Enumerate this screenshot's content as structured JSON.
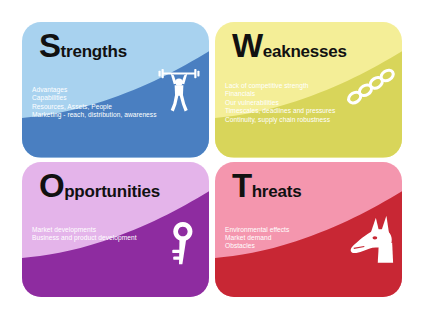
{
  "diagram": {
    "type": "swot-analysis",
    "background_color": "#ffffff",
    "cards": [
      {
        "id": "strengths",
        "initial": "S",
        "rest": "trengths",
        "light_color": "#a8d2ef",
        "dark_color": "#4a7fc1",
        "icon_name": "weightlifter-icon",
        "items": [
          "Advantages",
          "Capabilities",
          "Resources, Assets, People",
          "Marketing - reach, distribution, awareness"
        ]
      },
      {
        "id": "weaknesses",
        "initial": "W",
        "rest": "eaknesses",
        "light_color": "#f4ee97",
        "dark_color": "#d8d55a",
        "icon_name": "chain-links-icon",
        "items": [
          "Lack of competitive strength",
          "Financials",
          "Our vulnerabilities",
          "Timescales, deadlines and pressures",
          "Continuity, supply chain robustness"
        ]
      },
      {
        "id": "opportunities",
        "initial": "O",
        "rest": "pportunities",
        "light_color": "#e4b4ea",
        "dark_color": "#8e2ca0",
        "icon_name": "key-icon",
        "items": [
          "Market developments",
          "Business and product development"
        ]
      },
      {
        "id": "threats",
        "initial": "T",
        "rest": "hreats",
        "light_color": "#f496ae",
        "dark_color": "#c82734",
        "icon_name": "dog-head-icon",
        "items": [
          "Environmental effects",
          "Market demand",
          "Obstacles"
        ]
      }
    ]
  }
}
